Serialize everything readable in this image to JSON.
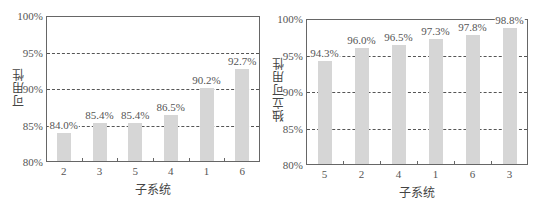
{
  "chart_data": [
    {
      "type": "bar",
      "title": "",
      "xlabel": "子系统",
      "ylabel": "可用性",
      "categories": [
        "2",
        "3",
        "5",
        "4",
        "1",
        "6"
      ],
      "values": [
        84.0,
        85.4,
        85.4,
        86.5,
        90.2,
        92.7
      ],
      "value_labels": [
        "84.0%",
        "85.4%",
        "85.4%",
        "86.5%",
        "90.2%",
        "92.7%"
      ],
      "ylim": [
        80,
        100
      ],
      "yticks": [
        "80%",
        "85%",
        "90%",
        "95%",
        "100%"
      ],
      "grid": "dashed horizontal at 85%, 90%, 95%",
      "legend": "none",
      "bar_color": "#d6d6d6"
    },
    {
      "type": "bar",
      "title": "",
      "xlabel": "子系统",
      "ylabel": "独立可用性",
      "categories": [
        "5",
        "2",
        "4",
        "1",
        "6",
        "3"
      ],
      "values": [
        94.3,
        96.0,
        96.5,
        97.3,
        97.8,
        98.8
      ],
      "value_labels": [
        "94.3%",
        "96.0%",
        "96.5%",
        "97.3%",
        "97.8%",
        "98.8%"
      ],
      "ylim": [
        80,
        100
      ],
      "yticks": [
        "80%",
        "85%",
        "90%",
        "95%",
        "100%"
      ],
      "grid": "dashed horizontal at 85%, 90%, 95%",
      "legend": "none",
      "bar_color": "#d6d6d6"
    }
  ]
}
